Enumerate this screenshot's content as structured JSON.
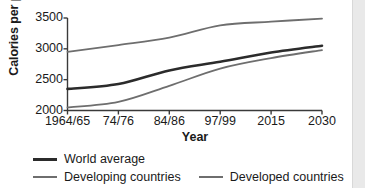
{
  "chart_data": {
    "type": "line",
    "title": "",
    "xlabel": "Year",
    "ylabel": "Calories per person",
    "categories": [
      "1964/65",
      "74/76",
      "84/86",
      "97/99",
      "2015",
      "2030"
    ],
    "ylim": [
      2000,
      3500
    ],
    "yticks": [
      2000,
      2500,
      3000,
      3500
    ],
    "grid": false,
    "legend_position": "bottom",
    "series": [
      {
        "name": "World average",
        "color": "#2b2b2b",
        "width": 2.6,
        "values": [
          2350,
          2430,
          2650,
          2790,
          2940,
          3050
        ]
      },
      {
        "name": "Developing countries",
        "color": "#6e6e6e",
        "width": 1.8,
        "values": [
          2050,
          2140,
          2400,
          2680,
          2850,
          2980
        ]
      },
      {
        "name": "Developed countries",
        "color": "#6e6e6e",
        "width": 1.8,
        "values": [
          2950,
          3060,
          3180,
          3380,
          3440,
          3490
        ]
      }
    ]
  },
  "axes": {
    "y_title": "Calories per person",
    "x_title": "Year",
    "y_tick_labels": [
      "3500",
      "3000",
      "2500",
      "2000"
    ],
    "x_tick_labels": [
      "1964/65",
      "74/76",
      "84/86",
      "97/99",
      "2015",
      "2030"
    ]
  },
  "legend": {
    "row1": [
      {
        "label": "World average",
        "style": "world"
      }
    ],
    "row2": [
      {
        "label": "Developing countries",
        "style": "gray"
      },
      {
        "label": "Developed countries",
        "style": "gray"
      }
    ]
  },
  "colors": {
    "world": "#2b2b2b",
    "developing": "#6e6e6e",
    "developed": "#6e6e6e",
    "axis": "#3a3a3a",
    "text": "#1a1a1a",
    "right_strip": "#e9e9e9"
  }
}
